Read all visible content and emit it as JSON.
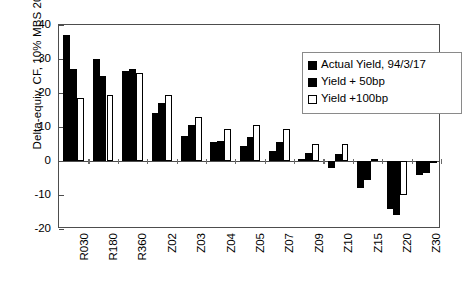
{
  "chart_data": {
    "type": "bar",
    "title": "",
    "xlabel": "",
    "ylabel": "Delta-equiv. CF, 10% MBS 2020",
    "ylim": [
      -20,
      40
    ],
    "yticks": [
      40,
      30,
      20,
      10,
      0,
      -10,
      -20
    ],
    "ytick_labels": [
      "40",
      "30",
      "20",
      "10",
      "0",
      "-10",
      "-20"
    ],
    "grid": false,
    "legend_position": "top-right",
    "categories": [
      "R030",
      "R180",
      "R360",
      "Z02",
      "Z03",
      "Z04",
      "Z05",
      "Z07",
      "Z09",
      "Z10",
      "Z15",
      "Z20",
      "Z30"
    ],
    "series": [
      {
        "name": "Actual Yield, 94/3/17",
        "fill": "solid-black",
        "color": "#000000",
        "values": [
          37,
          30,
          26.5,
          14,
          7.5,
          5.5,
          4.5,
          3,
          0.5,
          -2,
          -8,
          -14,
          -4
        ]
      },
      {
        "name": "Yield + 50bp",
        "fill": "solid-black",
        "color": "#000000",
        "values": [
          27,
          25,
          27,
          17,
          10.5,
          6,
          7,
          5.5,
          2.5,
          2,
          -5.5,
          -16,
          -3.5
        ]
      },
      {
        "name": "Yield +100bp",
        "fill": "white-outline",
        "color": "#ffffff",
        "values": [
          18.5,
          19.5,
          26,
          19.5,
          13,
          9.5,
          10.5,
          9.5,
          5,
          5,
          0.5,
          -10,
          -0.3
        ]
      }
    ]
  },
  "legend": {
    "items": [
      {
        "label": "Actual Yield, 94/3/17"
      },
      {
        "label": "Yield + 50bp"
      },
      {
        "label": "Yield +100bp"
      }
    ]
  }
}
